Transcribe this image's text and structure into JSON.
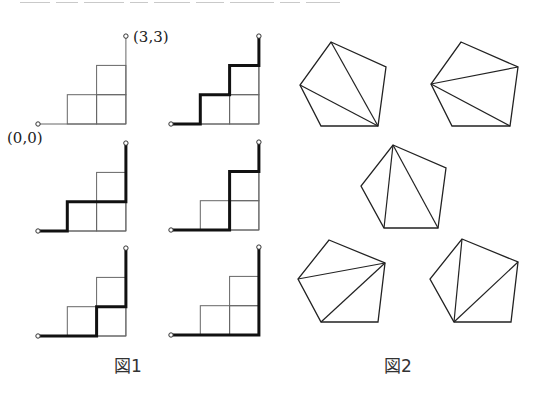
{
  "figure1": {
    "caption": "図1",
    "label_start": "(0,0)",
    "label_end": "(3,3)",
    "grid_size": 3,
    "panels": [
      {
        "id": "p1",
        "origin": [
          38,
          124
        ],
        "unit": 29.3,
        "path": []
      },
      {
        "id": "p2",
        "origin": [
          171,
          124
        ],
        "unit": 29.3,
        "path": [
          "R",
          "U",
          "R",
          "U",
          "R",
          "U"
        ]
      },
      {
        "id": "p3",
        "origin": [
          38,
          231
        ],
        "unit": 29.3,
        "path": [
          "R",
          "U",
          "R",
          "R",
          "U",
          "U"
        ]
      },
      {
        "id": "p4",
        "origin": [
          171,
          230
        ],
        "unit": 29.3,
        "path": [
          "R",
          "R",
          "U",
          "U",
          "R",
          "U"
        ]
      },
      {
        "id": "p5",
        "origin": [
          38,
          336
        ],
        "unit": 29.3,
        "path": [
          "R",
          "R",
          "U",
          "R",
          "U",
          "U"
        ]
      },
      {
        "id": "p6",
        "origin": [
          171,
          335
        ],
        "unit": 29.3,
        "path": [
          "R",
          "R",
          "R",
          "U",
          "U",
          "U"
        ]
      }
    ]
  },
  "figure2": {
    "caption": "図2",
    "pentagons": [
      {
        "id": "t1",
        "vertices": [
          [
            331,
            42
          ],
          [
            386,
            67
          ],
          [
            378,
            126
          ],
          [
            321,
            126
          ],
          [
            300,
            85
          ]
        ],
        "diagonals": [
          [
            2,
            0
          ],
          [
            2,
            4
          ]
        ]
      },
      {
        "id": "t2",
        "vertices": [
          [
            461,
            42
          ],
          [
            518,
            67
          ],
          [
            510,
            126
          ],
          [
            452,
            126
          ],
          [
            431,
            84
          ]
        ],
        "diagonals": [
          [
            4,
            1
          ],
          [
            4,
            2
          ]
        ]
      },
      {
        "id": "t3",
        "vertices": [
          [
            393,
            145
          ],
          [
            446,
            168
          ],
          [
            438,
            228
          ],
          [
            384,
            228
          ],
          [
            361,
            186
          ]
        ],
        "diagonals": [
          [
            0,
            3
          ],
          [
            0,
            2
          ]
        ]
      },
      {
        "id": "t4",
        "vertices": [
          [
            329,
            240
          ],
          [
            385,
            263
          ],
          [
            378,
            322
          ],
          [
            321,
            322
          ],
          [
            298,
            279
          ]
        ],
        "diagonals": [
          [
            1,
            4
          ],
          [
            1,
            3
          ]
        ]
      },
      {
        "id": "t5",
        "vertices": [
          [
            462,
            239
          ],
          [
            518,
            262
          ],
          [
            511,
            322
          ],
          [
            454,
            322
          ],
          [
            430,
            279
          ]
        ],
        "diagonals": [
          [
            3,
            0
          ],
          [
            3,
            1
          ]
        ]
      }
    ]
  }
}
